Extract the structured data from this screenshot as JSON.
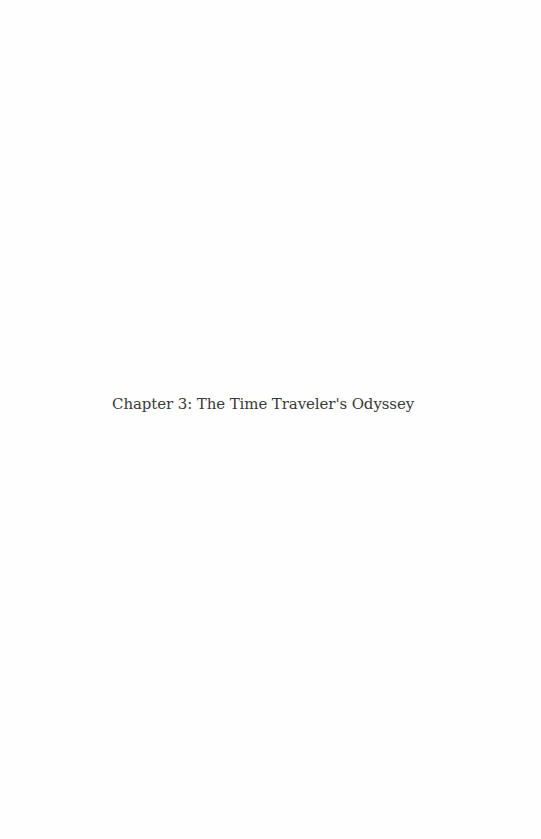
{
  "page": {
    "chapter_title": "Chapter 3: The Time Traveler's Odyssey"
  },
  "colors": {
    "background": "#fefefe",
    "text": "#3a3a3a"
  }
}
